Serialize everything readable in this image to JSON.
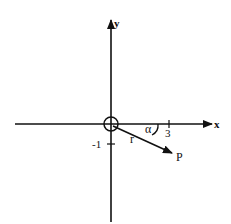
{
  "diagram": {
    "axes": {
      "x_label": "x",
      "y_label": "y"
    },
    "ticks": {
      "x_tick_label": "3",
      "y_tick_label": "-1"
    },
    "vector": {
      "label": "r",
      "endpoint_label": "P",
      "angle_label": "α"
    },
    "colors": {
      "ink": "#111111",
      "background": "#ffffff"
    }
  }
}
